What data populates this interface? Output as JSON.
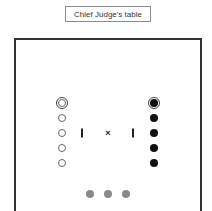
{
  "label": {
    "text": "Chief Judge's table"
  },
  "table": {
    "border_color": "#333333"
  },
  "left_column": {
    "x": 62,
    "marker_type": "open-circle",
    "ringed_index": 0,
    "ys": [
      103,
      118,
      133,
      148,
      163
    ]
  },
  "right_column": {
    "x": 154,
    "marker_type": "filled-circle",
    "ringed_index": 0,
    "ys": [
      103,
      118,
      133,
      148,
      163
    ]
  },
  "center": {
    "bars_x": [
      82,
      133
    ],
    "cross_x": 108,
    "y": 133,
    "cross_symbol": "×"
  },
  "bottom_dots": {
    "xs": [
      90,
      108,
      126
    ],
    "y": 194,
    "color": "#8a8a8a"
  }
}
